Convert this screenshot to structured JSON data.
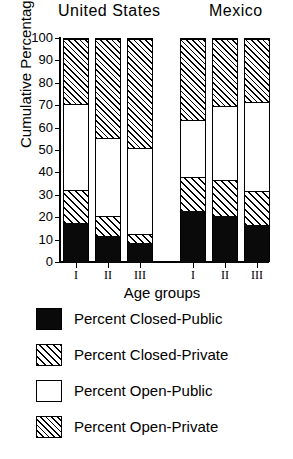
{
  "chart_data": {
    "type": "bar",
    "stacked": true,
    "title": "",
    "xlabel": "Age groups",
    "ylabel": "Cumulative Percentage",
    "ylim": [
      0,
      100
    ],
    "ytick_labels": [
      "100",
      "90",
      "80",
      "70",
      "60",
      "50",
      "40",
      "30",
      "20",
      "10",
      "0"
    ],
    "ytick_values": [
      100,
      90,
      80,
      70,
      60,
      50,
      40,
      30,
      20,
      10,
      0
    ],
    "grid": false,
    "legend_position": "below",
    "group_labels": [
      "United States",
      "Mexico"
    ],
    "categories": [
      "I",
      "II",
      "III",
      "I",
      "II",
      "III"
    ],
    "groups": [
      {
        "name": "United States",
        "categories": [
          "I",
          "II",
          "III"
        ],
        "bars": [
          {
            "label": "I",
            "cumulative": [
              18,
              32.5,
              71,
              100
            ],
            "segments": [
              18,
              14.5,
              38.5,
              29
            ]
          },
          {
            "label": "II",
            "cumulative": [
              12,
              21,
              56,
              100
            ],
            "segments": [
              12,
              9,
              35,
              44
            ]
          },
          {
            "label": "III",
            "cumulative": [
              9,
              13,
              51.5,
              100
            ],
            "segments": [
              9,
              4,
              38.5,
              48.5
            ]
          }
        ]
      },
      {
        "name": "Mexico",
        "categories": [
          "I",
          "II",
          "III"
        ],
        "bars": [
          {
            "label": "I",
            "cumulative": [
              23,
              38.5,
              64,
              100
            ],
            "segments": [
              23,
              15.5,
              25.5,
              36
            ]
          },
          {
            "label": "II",
            "cumulative": [
              21,
              37,
              70,
              100
            ],
            "segments": [
              21,
              16,
              33,
              30
            ]
          },
          {
            "label": "III",
            "cumulative": [
              17,
              32,
              72,
              100
            ],
            "segments": [
              17,
              15,
              40,
              28
            ]
          }
        ]
      }
    ],
    "series": [
      {
        "name": "Percent Closed-Public",
        "pattern": "solid-black",
        "color": "#0a0a0a",
        "values": [
          18,
          12,
          9,
          23,
          21,
          17
        ]
      },
      {
        "name": "Percent Closed-Private",
        "pattern": "coarse-hatch",
        "color": "#ffffff",
        "values": [
          14.5,
          9,
          4,
          15.5,
          16,
          15
        ]
      },
      {
        "name": "Percent Open-Public",
        "pattern": "white",
        "color": "#ffffff",
        "values": [
          38.5,
          35,
          38.5,
          25.5,
          33,
          40
        ]
      },
      {
        "name": "Percent Open-Private",
        "pattern": "fine-hatch",
        "color": "#ffffff",
        "values": [
          29,
          44,
          48.5,
          36,
          30,
          28
        ]
      }
    ],
    "legend": [
      {
        "label": "Percent Closed-Public",
        "pattern": "solid-black"
      },
      {
        "label": "Percent Closed-Private",
        "pattern": "coarse-hatch"
      },
      {
        "label": "Percent Open-Public",
        "pattern": "white"
      },
      {
        "label": "Percent Open-Private",
        "pattern": "fine-hatch"
      }
    ]
  }
}
